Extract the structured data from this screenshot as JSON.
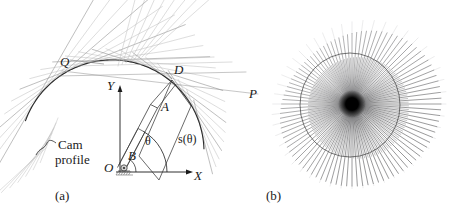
{
  "figure": {
    "panels": [
      {
        "key": "a",
        "caption": "(a)",
        "labels": {
          "point_Q": "Q",
          "point_D": "D",
          "point_P": "P",
          "point_O": "O",
          "axis_y": "Y",
          "axis_x": "X",
          "arm_A": "A",
          "arm_B": "B",
          "angle_theta": "θ",
          "distance_s": "s(θ)",
          "cam_profile_line1": "Cam",
          "cam_profile_line2": "profile"
        }
      },
      {
        "key": "b",
        "caption": "(b)"
      }
    ],
    "colors": {
      "ink": "#1a1a1a",
      "curve": "#2b2b2b",
      "tangent_light": "#b9b9b9",
      "tangent_mid": "#8e8e8e",
      "background": "#ffffff",
      "envelope_core": "#000000"
    },
    "geometry_a": {
      "origin": {
        "x": 120,
        "y": 172
      },
      "x_axis_end": {
        "x": 192,
        "y": 172
      },
      "y_axis_top": {
        "x": 120,
        "y": 86
      },
      "point_D": {
        "x": 172,
        "y": 80
      },
      "tangent_count": 22
    },
    "geometry_b": {
      "center": {
        "x": 352,
        "y": 104
      },
      "ray_count": 96,
      "inner_radius": 6,
      "outer_radius_mean": 78
    }
  }
}
